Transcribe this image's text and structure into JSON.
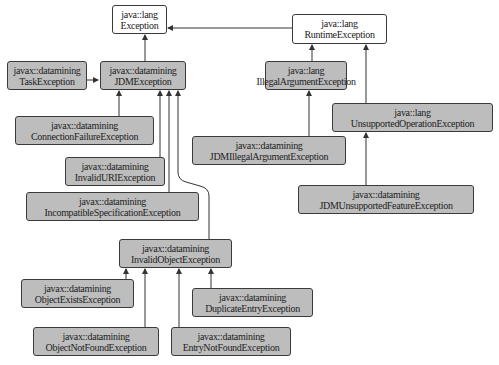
{
  "diagram": {
    "type": "class-inheritance",
    "colors": {
      "base_fill": "#ffffff",
      "derived_fill": "#bdbdbd",
      "border": "#3a3a3a",
      "edge": "#333333"
    },
    "nodes": {
      "exception": {
        "package": "java::lang",
        "name": "Exception"
      },
      "runtime": {
        "package": "java::lang",
        "name": "RuntimeException"
      },
      "task": {
        "package": "javax::datamining",
        "name": "TaskException"
      },
      "jdm": {
        "package": "javax::datamining",
        "name": "JDMException"
      },
      "illegalarg": {
        "package": "java::lang",
        "name": "IllegalArgumentException"
      },
      "connfail": {
        "package": "javax::datamining",
        "name": "ConnectionFailureException"
      },
      "unsupop": {
        "package": "java::lang",
        "name": "UnsupportedOperationException"
      },
      "jdmillegal": {
        "package": "javax::datamining",
        "name": "JDMIllegalArgumentException"
      },
      "invaliduri": {
        "package": "javax::datamining",
        "name": "InvalidURIException"
      },
      "incompat": {
        "package": "javax::datamining",
        "name": "IncompatibleSpecificationException"
      },
      "jdmunsup": {
        "package": "javax::datamining",
        "name": "JDMUnsupportedFeatureException"
      },
      "invalidobj": {
        "package": "javax::datamining",
        "name": "InvalidObjectException"
      },
      "objexists": {
        "package": "javax::datamining",
        "name": "ObjectExistsException"
      },
      "dupentry": {
        "package": "javax::datamining",
        "name": "DuplicateEntryException"
      },
      "objnotfound": {
        "package": "javax::datamining",
        "name": "ObjectNotFoundException"
      },
      "entrynotfound": {
        "package": "javax::datamining",
        "name": "EntryNotFoundException"
      }
    },
    "edges": [
      {
        "from": "RuntimeException",
        "to": "Exception"
      },
      {
        "from": "JDMException",
        "to": "Exception"
      },
      {
        "from": "TaskException",
        "to": "JDMException"
      },
      {
        "from": "ConnectionFailureException",
        "to": "JDMException"
      },
      {
        "from": "InvalidURIException",
        "to": "JDMException"
      },
      {
        "from": "IncompatibleSpecificationException",
        "to": "JDMException"
      },
      {
        "from": "InvalidObjectException",
        "to": "JDMException"
      },
      {
        "from": "IllegalArgumentException",
        "to": "RuntimeException"
      },
      {
        "from": "UnsupportedOperationException",
        "to": "RuntimeException"
      },
      {
        "from": "JDMIllegalArgumentException",
        "to": "IllegalArgumentException"
      },
      {
        "from": "JDMUnsupportedFeatureException",
        "to": "UnsupportedOperationException"
      },
      {
        "from": "ObjectExistsException",
        "to": "InvalidObjectException"
      },
      {
        "from": "ObjectNotFoundException",
        "to": "InvalidObjectException"
      },
      {
        "from": "EntryNotFoundException",
        "to": "InvalidObjectException"
      },
      {
        "from": "DuplicateEntryException",
        "to": "InvalidObjectException"
      }
    ]
  }
}
